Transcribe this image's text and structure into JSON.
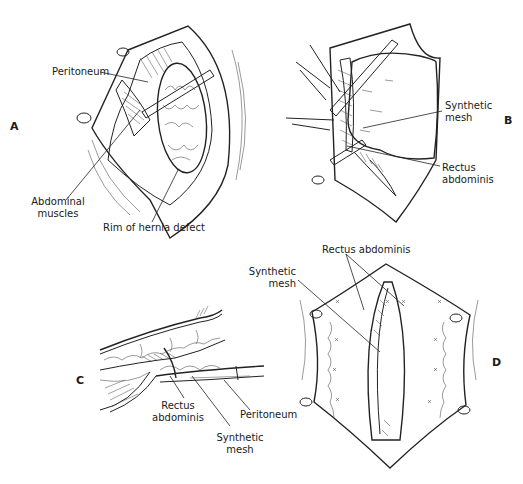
{
  "figure": {
    "panels": [
      {
        "letter": "A",
        "labels": {
          "peritoneum": "Peritoneum",
          "abdominal_muscles_1": "Abdominal",
          "abdominal_muscles_2": "muscles",
          "rim": "Rim of hernia defect"
        }
      },
      {
        "letter": "B",
        "labels": {
          "mesh_1": "Synthetic",
          "mesh_2": "mesh",
          "rectus_1": "Rectus",
          "rectus_2": "abdominis"
        }
      },
      {
        "letter": "C",
        "labels": {
          "rectus_1": "Rectus",
          "rectus_2": "abdominis",
          "peritoneum": "Peritoneum",
          "mesh_1": "Synthetic",
          "mesh_2": "mesh"
        }
      },
      {
        "letter": "D",
        "labels": {
          "rectus": "Rectus abdominis",
          "mesh_1": "Synthetic",
          "mesh_2": "mesh"
        }
      }
    ]
  }
}
